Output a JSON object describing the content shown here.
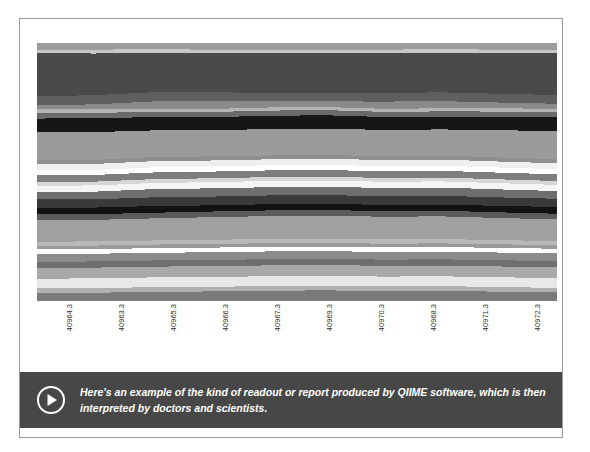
{
  "card": {
    "frame_color": "#9a9a9a",
    "background": "#ffffff"
  },
  "caption": {
    "text": "Here's an example of the kind of readout or report produced by QIIME software, which is then interpreted by doctors and scientists.",
    "background": "#474747",
    "text_color": "#ffffff",
    "play_icon": "play-circle-icon"
  },
  "chart_data": {
    "type": "area",
    "title": "",
    "xlabel": "",
    "ylabel": "",
    "grid": false,
    "legend": "none",
    "stacked": true,
    "normalized": true,
    "ylim": [
      0,
      100
    ],
    "categories": [
      "40964.3",
      "40963.3",
      "40965.3",
      "40966.3",
      "40967.3",
      "40969.3",
      "40970.3",
      "40968.3",
      "40971.3",
      "40972.3"
    ],
    "tick_labels": [
      "40964.3",
      "40963.3",
      "40965.3",
      "40966.3",
      "40967.3",
      "40969.3",
      "40970.3",
      "40968.3",
      "40971.3",
      "40972.3"
    ],
    "series": [
      {
        "name": "taxon-01",
        "color": "#9d9d9d",
        "values": [
          2.6,
          2.6,
          2.4,
          2.6,
          2.6,
          2.6,
          2.6,
          2.4,
          2.6,
          2.6
        ]
      },
      {
        "name": "taxon-02",
        "color": "#c8c8c8",
        "values": [
          1.4,
          1.5,
          1.4,
          1.4,
          1.4,
          1.3,
          1.4,
          1.4,
          1.3,
          1.4
        ]
      },
      {
        "name": "taxon-03",
        "color": "#4a4a4a",
        "values": [
          16.8,
          16.2,
          15.4,
          15.2,
          15.2,
          15.4,
          15.4,
          15.4,
          15.8,
          16.2
        ]
      },
      {
        "name": "taxon-04",
        "color": "#5f5f5f",
        "values": [
          3.4,
          3.6,
          3.6,
          3.4,
          3.2,
          3.3,
          3.4,
          3.4,
          3.4,
          3.4
        ]
      },
      {
        "name": "taxon-05",
        "color": "#8a8a8a",
        "values": [
          1.6,
          1.8,
          2.8,
          3.0,
          2.6,
          2.2,
          2.8,
          2.8,
          2.2,
          2.0
        ]
      },
      {
        "name": "taxon-06",
        "color": "#b4b4b4",
        "values": [
          1.5,
          1.5,
          1.3,
          1.2,
          1.2,
          1.2,
          1.2,
          1.2,
          1.3,
          1.3
        ]
      },
      {
        "name": "taxon-07",
        "color": "#6a6a6a",
        "values": [
          2.1,
          2.1,
          2.0,
          2.0,
          2.0,
          2.0,
          2.0,
          2.0,
          2.0,
          2.0
        ]
      },
      {
        "name": "taxon-08",
        "color": "#161616",
        "values": [
          5.4,
          5.4,
          5.2,
          5.0,
          5.2,
          5.2,
          5.0,
          5.0,
          5.2,
          5.4
        ]
      },
      {
        "name": "taxon-09",
        "color": "#9b9b9b",
        "values": [
          10.8,
          10.8,
          10.4,
          10.2,
          10.2,
          10.2,
          10.2,
          10.2,
          10.6,
          10.8
        ]
      },
      {
        "name": "taxon-10",
        "color": "#8f8f8f",
        "values": [
          1.6,
          1.6,
          1.6,
          1.6,
          1.5,
          1.5,
          1.5,
          1.5,
          1.6,
          1.6
        ]
      },
      {
        "name": "taxon-11",
        "color": "#efefef",
        "values": [
          2.2,
          2.3,
          2.4,
          2.3,
          2.3,
          2.3,
          2.4,
          2.4,
          2.3,
          2.3
        ]
      },
      {
        "name": "taxon-12",
        "color": "#ffffff",
        "values": [
          2.0,
          2.0,
          2.0,
          2.0,
          2.0,
          2.0,
          2.0,
          2.0,
          2.0,
          2.0
        ]
      },
      {
        "name": "taxon-13",
        "color": "#7e7e7e",
        "values": [
          2.6,
          2.6,
          2.6,
          2.6,
          2.6,
          2.6,
          2.6,
          2.6,
          2.6,
          2.6
        ]
      },
      {
        "name": "taxon-14",
        "color": "#d6d6d6",
        "values": [
          1.5,
          1.5,
          1.5,
          1.5,
          1.5,
          1.5,
          1.5,
          1.5,
          1.5,
          1.5
        ]
      },
      {
        "name": "taxon-15",
        "color": "#f4f4f4",
        "values": [
          2.4,
          2.4,
          2.4,
          2.4,
          2.4,
          2.4,
          2.4,
          2.4,
          2.4,
          2.4
        ]
      },
      {
        "name": "taxon-16",
        "color": "#6e6e6e",
        "values": [
          3.0,
          3.0,
          3.2,
          3.2,
          3.2,
          3.2,
          3.2,
          3.2,
          3.1,
          3.0
        ]
      },
      {
        "name": "taxon-17",
        "color": "#3a3a3a",
        "values": [
          3.2,
          3.2,
          3.4,
          3.4,
          3.4,
          3.4,
          3.4,
          3.4,
          3.3,
          3.2
        ]
      },
      {
        "name": "taxon-18",
        "color": "#121212",
        "values": [
          2.6,
          2.6,
          2.6,
          2.4,
          2.4,
          2.4,
          2.4,
          2.4,
          2.5,
          2.6
        ]
      },
      {
        "name": "taxon-19",
        "color": "#5b5b5b",
        "values": [
          2.2,
          2.2,
          2.2,
          2.2,
          2.2,
          2.2,
          2.2,
          2.2,
          2.2,
          2.2
        ]
      },
      {
        "name": "taxon-20",
        "color": "#a0a0a0",
        "values": [
          8.4,
          8.4,
          8.6,
          8.8,
          8.8,
          8.8,
          8.8,
          8.8,
          8.6,
          8.4
        ]
      },
      {
        "name": "taxon-21",
        "color": "#b8b8b8",
        "values": [
          1.6,
          1.6,
          1.6,
          1.6,
          1.7,
          1.7,
          1.7,
          1.7,
          1.6,
          1.6
        ]
      },
      {
        "name": "taxon-22",
        "color": "#9a9a9a",
        "values": [
          1.4,
          1.4,
          1.4,
          1.4,
          1.4,
          1.4,
          1.4,
          1.4,
          1.4,
          1.4
        ]
      },
      {
        "name": "taxon-23",
        "color": "#fdfdfd",
        "values": [
          1.8,
          1.8,
          1.8,
          1.8,
          1.8,
          1.8,
          1.8,
          1.8,
          1.8,
          1.8
        ]
      },
      {
        "name": "taxon-24",
        "color": "#8b8b8b",
        "values": [
          3.0,
          3.0,
          3.0,
          3.0,
          3.0,
          3.0,
          3.0,
          3.0,
          3.0,
          3.0
        ]
      },
      {
        "name": "taxon-25",
        "color": "#6f6f6f",
        "values": [
          2.4,
          2.4,
          2.4,
          2.4,
          2.4,
          2.4,
          2.4,
          2.4,
          2.4,
          2.4
        ]
      },
      {
        "name": "taxon-26",
        "color": "#a8a8a8",
        "values": [
          4.2,
          4.2,
          4.2,
          4.2,
          4.2,
          4.2,
          4.2,
          4.2,
          4.2,
          4.2
        ]
      },
      {
        "name": "taxon-27",
        "color": "#e8e8e8",
        "values": [
          3.8,
          3.8,
          3.8,
          3.8,
          3.8,
          3.8,
          3.8,
          3.8,
          3.8,
          3.8
        ]
      },
      {
        "name": "taxon-28",
        "color": "#b0b0b0",
        "values": [
          1.8,
          1.8,
          1.8,
          1.8,
          1.8,
          1.8,
          1.8,
          1.8,
          1.8,
          1.8
        ]
      },
      {
        "name": "taxon-29",
        "color": "#7a7a7a",
        "values": [
          3.1,
          3.2,
          3.6,
          3.7,
          4.0,
          4.1,
          3.9,
          4.0,
          3.6,
          3.3
        ]
      }
    ]
  }
}
